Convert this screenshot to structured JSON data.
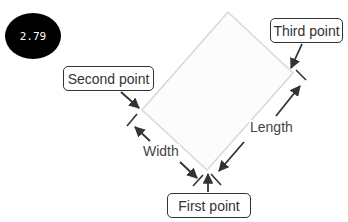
{
  "badge": {
    "value": "2.79"
  },
  "callouts": {
    "first_point": "First point",
    "second_point": "Second point",
    "third_point": "Third point"
  },
  "dimensions": {
    "width": "Width",
    "length": "Length"
  },
  "colors": {
    "rectangle_outline": "#d8d8d8",
    "arrow": "#333333",
    "callout_border": "#333333",
    "badge_bg": "#000000",
    "badge_text": "#ffffff"
  }
}
